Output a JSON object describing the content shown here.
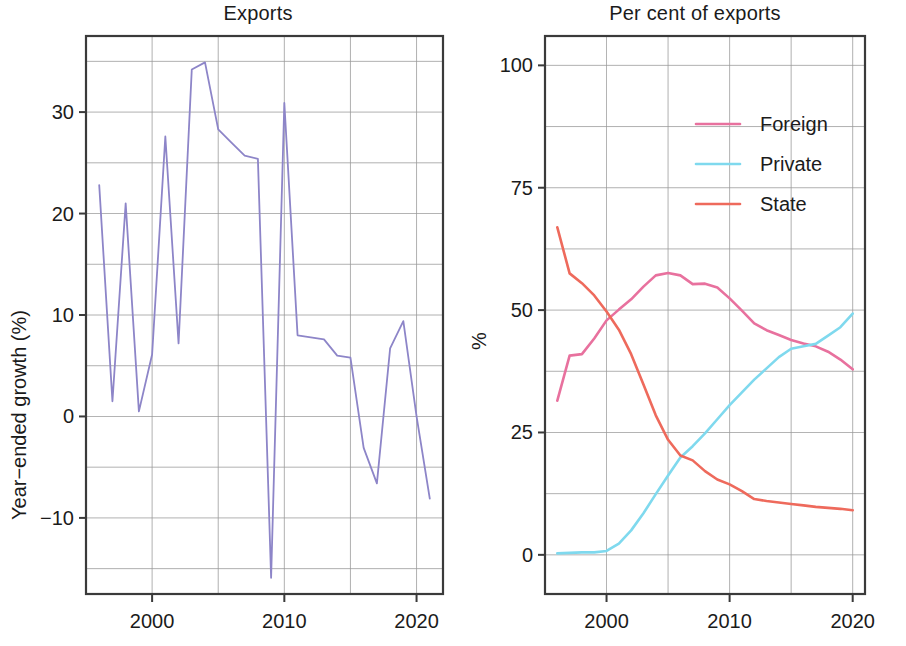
{
  "figure": {
    "width": 906,
    "height": 646,
    "background": "#ffffff"
  },
  "panels": [
    {
      "id": "exports-growth",
      "title": "Exports",
      "ylabel": "Year−ended growth (%)",
      "xlabel": ""
    },
    {
      "id": "per-cent-of-exports",
      "title": "Per cent of exports",
      "ylabel": "%",
      "xlabel": ""
    }
  ],
  "colors": {
    "purple": "#8d85c8",
    "foreign": "#e8719e",
    "private": "#7fd9ee",
    "state": "#ee6a5c",
    "axis": "#3a3a3a",
    "grid": "#9a9a9a",
    "text": "#1b1b1b"
  },
  "legend": {
    "position": "upper-right-inside",
    "entries": [
      {
        "label": "Foreign",
        "color": "#e8719e"
      },
      {
        "label": "Private",
        "color": "#7fd9ee"
      },
      {
        "label": "State",
        "color": "#ee6a5c"
      }
    ]
  },
  "chart_data": [
    {
      "type": "line",
      "title": "Exports",
      "xlabel": "",
      "ylabel": "Year−ended growth (%)",
      "xlim": [
        1995.0,
        2022.0
      ],
      "ylim": [
        -17.5,
        37.5
      ],
      "xticks": [
        2000,
        2010,
        2020
      ],
      "xticklabels": [
        "2000",
        "2010",
        "2020"
      ],
      "yticks": [
        -10,
        0,
        10,
        20,
        30
      ],
      "yticklabels": [
        "−10",
        "0",
        "10",
        "20",
        "30"
      ],
      "grid": true,
      "grid_x_minor": [
        1995,
        2000,
        2005,
        2010,
        2015,
        2020
      ],
      "grid_y_minor": [
        -15,
        -10,
        -5,
        0,
        5,
        10,
        15,
        20,
        25,
        30,
        35
      ],
      "series": [
        {
          "name": "Year-ended export growth",
          "color": "#8d85c8",
          "x": [
            1996,
            1997,
            1998,
            1999,
            2000,
            2001,
            2002,
            2003,
            2004,
            2005,
            2006,
            2007,
            2008,
            2009,
            2010,
            2011,
            2012,
            2013,
            2014,
            2015,
            2016,
            2017,
            2018,
            2019,
            2020,
            2021
          ],
          "y": [
            22.8,
            1.5,
            21.0,
            0.5,
            6.1,
            27.6,
            7.2,
            34.2,
            34.9,
            28.3,
            27.0,
            25.7,
            25.4,
            -15.9,
            30.9,
            8.0,
            7.8,
            7.6,
            6.0,
            5.8,
            -3.1,
            -6.6,
            6.7,
            9.4,
            0.0,
            -8.1
          ]
        }
      ]
    },
    {
      "type": "line",
      "title": "Per cent of exports",
      "xlabel": "",
      "ylabel": "%",
      "xlim": [
        1995.0,
        2021.0
      ],
      "ylim": [
        -8.0,
        106.0
      ],
      "xticks": [
        2000,
        2010,
        2020
      ],
      "xticklabels": [
        "2000",
        "2010",
        "2020"
      ],
      "yticks": [
        0,
        25,
        50,
        75,
        100
      ],
      "yticklabels": [
        "0",
        "25",
        "50",
        "75",
        "100"
      ],
      "grid": true,
      "grid_x_minor": [
        1995,
        2000,
        2005,
        2010,
        2015,
        2020
      ],
      "grid_y_minor": [
        0,
        12.5,
        25,
        37.5,
        50,
        62.5,
        75,
        87.5,
        100
      ],
      "series": [
        {
          "name": "Foreign",
          "color": "#e8719e",
          "x": [
            1996,
            1997,
            1998,
            1999,
            2000,
            2001,
            2002,
            2003,
            2004,
            2005,
            2006,
            2007,
            2008,
            2009,
            2010,
            2011,
            2012,
            2013,
            2014,
            2015,
            2016,
            2017,
            2018,
            2019,
            2020
          ],
          "y": [
            31.5,
            40.7,
            41.0,
            44.2,
            47.9,
            50.1,
            52.2,
            54.8,
            57.1,
            57.6,
            57.1,
            55.3,
            55.4,
            54.6,
            52.4,
            49.9,
            47.3,
            45.9,
            44.9,
            43.9,
            43.2,
            42.6,
            41.5,
            39.9,
            37.9
          ]
        },
        {
          "name": "Private",
          "color": "#7fd9ee",
          "x": [
            1996,
            1997,
            1998,
            1999,
            2000,
            2001,
            2002,
            2003,
            2004,
            2005,
            2006,
            2007,
            2008,
            2009,
            2010,
            2011,
            2012,
            2013,
            2014,
            2015,
            2016,
            2017,
            2018,
            2019,
            2020
          ],
          "y": [
            0.3,
            0.4,
            0.5,
            0.5,
            0.8,
            2.3,
            5.0,
            8.5,
            12.4,
            16.2,
            19.9,
            22.2,
            24.8,
            27.7,
            30.6,
            33.2,
            35.8,
            38.1,
            40.4,
            42.1,
            42.6,
            43.1,
            44.8,
            46.5,
            49.3
          ]
        },
        {
          "name": "State",
          "color": "#ee6a5c",
          "x": [
            1996,
            1997,
            1998,
            1999,
            2000,
            2001,
            2002,
            2003,
            2004,
            2005,
            2006,
            2007,
            2008,
            2009,
            2010,
            2011,
            2012,
            2013,
            2014,
            2015,
            2016,
            2017,
            2018,
            2019,
            2020
          ],
          "y": [
            66.9,
            57.5,
            55.5,
            53.0,
            49.7,
            46.0,
            41.0,
            34.8,
            28.5,
            23.5,
            20.3,
            19.3,
            17.1,
            15.4,
            14.4,
            13.0,
            11.4,
            11.0,
            10.7,
            10.4,
            10.1,
            9.8,
            9.6,
            9.4,
            9.1
          ]
        }
      ]
    }
  ]
}
